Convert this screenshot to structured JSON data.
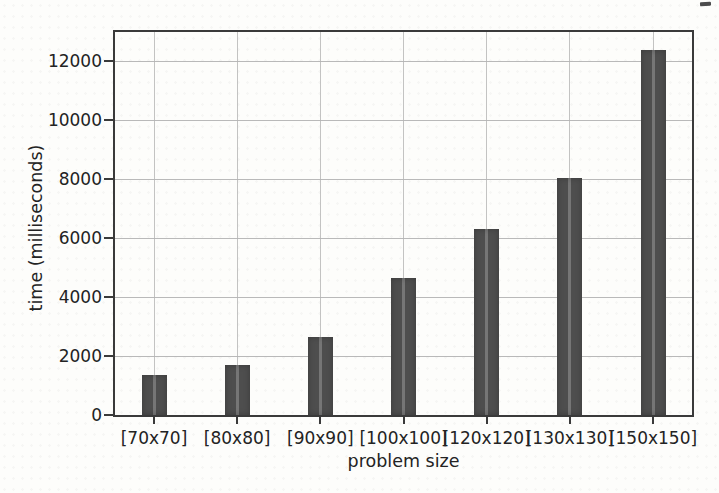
{
  "chart_data": {
    "type": "bar",
    "title": "",
    "categories": [
      "[70x70]",
      "[80x80]",
      "[90x90]",
      "[100x100]",
      "[120x120]",
      "[130x130]",
      "[150x150]"
    ],
    "values": [
      1350,
      1700,
      2650,
      4650,
      6300,
      8050,
      12400
    ],
    "xlabel": "problem size",
    "ylabel": "time (milliseconds)",
    "ylim": [
      0,
      13000
    ],
    "yticks": [
      0,
      2000,
      4000,
      6000,
      8000,
      10000,
      12000
    ],
    "grid": true,
    "legend_position": "none",
    "bar_color": "#4e4e4e",
    "grid_color": "#b0b0b0",
    "axis_color": "#3a3a3a",
    "text_color": "#232323"
  }
}
